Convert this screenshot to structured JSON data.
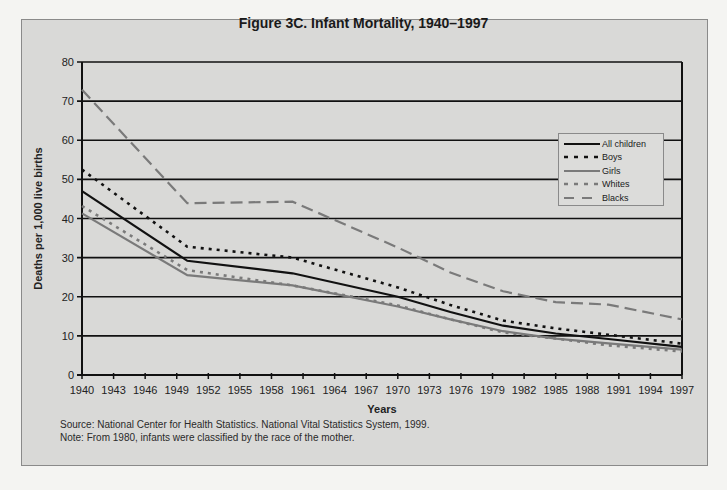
{
  "title": "Figure 3C. Infant Mortality, 1940–1997",
  "footnotes": {
    "source": "Source: National Center for Health Statistics. National Vital Statistics System, 1999.",
    "note": "Note: From 1980, infants were classified by the race of the mother."
  },
  "chart_data": {
    "type": "line",
    "title": "Figure 3C. Infant Mortality, 1940–1997",
    "xlabel": "Years",
    "ylabel": "Deaths per 1,000 live births",
    "ylim": [
      0,
      80
    ],
    "xlim": [
      1940,
      1997
    ],
    "yticks": [
      0,
      10,
      20,
      30,
      40,
      50,
      60,
      70,
      80
    ],
    "xticks": [
      1940,
      1943,
      1946,
      1949,
      1952,
      1955,
      1958,
      1961,
      1964,
      1967,
      1970,
      1973,
      1976,
      1979,
      1982,
      1985,
      1988,
      1991,
      1994,
      1997
    ],
    "grid": "horizontal",
    "legend_position": "right-inside",
    "x": [
      1940,
      1950,
      1960,
      1970,
      1975,
      1980,
      1985,
      1990,
      1997
    ],
    "series": [
      {
        "name": "All children",
        "style": "solid",
        "color": "#111111",
        "values": [
          47.0,
          29.2,
          26.0,
          20.0,
          16.1,
          12.6,
          10.6,
          9.2,
          7.2
        ]
      },
      {
        "name": "Boys",
        "style": "dotted",
        "color": "#111111",
        "values": [
          52.5,
          32.8,
          30.0,
          22.4,
          17.9,
          13.9,
          11.9,
          10.3,
          8.0
        ]
      },
      {
        "name": "Girls",
        "style": "solid",
        "color": "#7a7a7a",
        "values": [
          41.3,
          25.5,
          22.9,
          17.5,
          14.2,
          11.2,
          9.3,
          8.1,
          6.5
        ]
      },
      {
        "name": "Whites",
        "style": "dotted",
        "color": "#7a7a7a",
        "values": [
          43.2,
          26.8,
          22.9,
          17.8,
          14.2,
          10.9,
          9.3,
          7.6,
          6.0
        ]
      },
      {
        "name": "Blacks",
        "style": "dashed",
        "color": "#7a7a7a",
        "values": [
          72.9,
          43.9,
          44.3,
          32.6,
          26.2,
          21.4,
          18.6,
          18.0,
          14.2
        ]
      }
    ]
  }
}
